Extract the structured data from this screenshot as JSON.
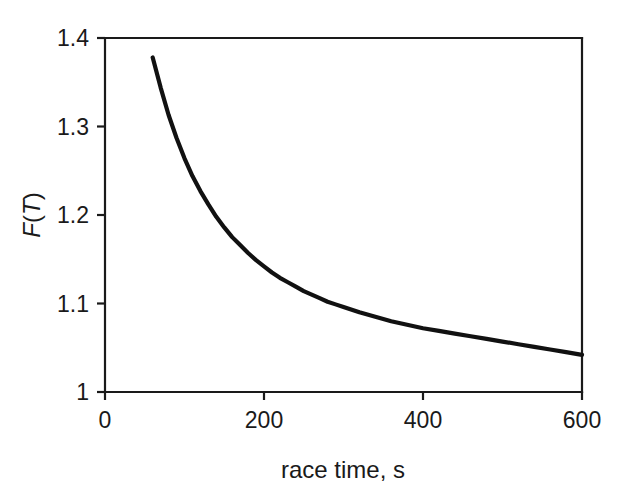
{
  "chart_data": {
    "type": "line",
    "title": "",
    "subtitle": "",
    "xlabel": "race time, s",
    "ylabel": "F(T)",
    "ylabel_parts": {
      "italic_f": "F",
      "paren_open": "(",
      "italic_t": "T",
      "paren_close": ")"
    },
    "xlim": [
      0,
      600
    ],
    "ylim": [
      1,
      1.4
    ],
    "xticks": [
      0,
      200,
      400,
      600
    ],
    "xtick_labels": [
      "0",
      "200",
      "400",
      "600"
    ],
    "yticks": [
      1,
      1.1,
      1.2,
      1.3,
      1.4
    ],
    "ytick_labels": [
      "1",
      "1.1",
      "1.2",
      "1.3",
      "1.4"
    ],
    "grid": false,
    "legend": null,
    "legend_position": "none",
    "annotations": [],
    "series": [
      {
        "name": "F(T)",
        "color": "#111111",
        "line_width": 4.2,
        "marker": "none",
        "x": [
          60,
          70,
          80,
          90,
          100,
          110,
          120,
          130,
          140,
          150,
          160,
          170,
          180,
          190,
          200,
          210,
          220,
          230,
          240,
          250,
          260,
          270,
          280,
          290,
          300,
          320,
          340,
          360,
          380,
          400,
          420,
          440,
          460,
          480,
          500,
          520,
          540,
          560,
          580,
          600
        ],
        "y": [
          1.378,
          1.344,
          1.313,
          1.287,
          1.264,
          1.244,
          1.227,
          1.212,
          1.198,
          1.186,
          1.175,
          1.166,
          1.157,
          1.149,
          1.142,
          1.135,
          1.129,
          1.124,
          1.119,
          1.114,
          1.11,
          1.106,
          1.102,
          1.099,
          1.096,
          1.09,
          1.085,
          1.08,
          1.076,
          1.072,
          1.069,
          1.066,
          1.063,
          1.06,
          1.057,
          1.054,
          1.051,
          1.048,
          1.045,
          1.042
        ]
      }
    ]
  },
  "axes": {
    "plot_box": {
      "left": 105,
      "right": 582,
      "top": 38,
      "bottom": 392
    },
    "frame_color": "#1a1a1a",
    "background": "#ffffff"
  }
}
